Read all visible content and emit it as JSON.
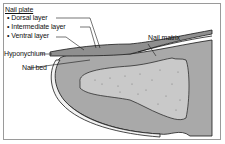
{
  "diagram": {
    "title": "Nail plate",
    "nail_plate_layers": [
      {
        "label": "Dorsal layer"
      },
      {
        "label": "Intermediate layer"
      },
      {
        "label": "Ventral layer"
      }
    ],
    "labels": {
      "nail_matrix": "Nail matrix",
      "hyponychium": "Hyponychium",
      "nail_bed": "Nail bed"
    },
    "colors": {
      "soft_tissue": "#a9a9a9",
      "bone": "#c9c9c9",
      "nail_plate": "#8f8f8f",
      "outline": "#1a1a1a",
      "skin_edge": "#f2f2f2"
    }
  }
}
